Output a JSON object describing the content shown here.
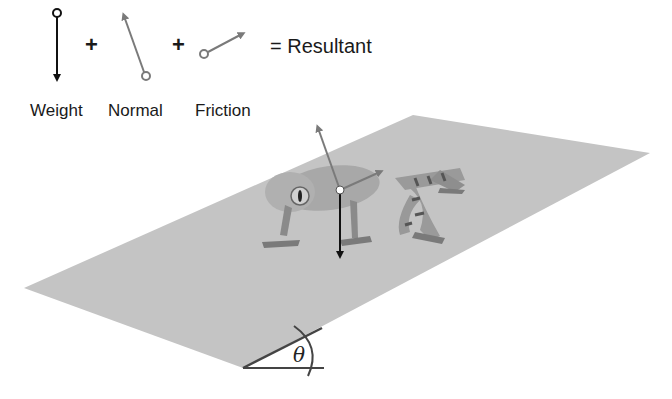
{
  "legend": {
    "weight_label": "Weight",
    "normal_label": "Normal",
    "friction_label": "Friction",
    "plus_1": "+",
    "plus_2": "+",
    "resultant_label": "= Resultant"
  },
  "diagram": {
    "angle_symbol": "θ",
    "colors": {
      "plane": "#c4c4c4",
      "weight_arrow": "#111111",
      "normal_arrow": "#7a7a7a",
      "friction_arrow": "#7a7a7a",
      "frog_body": "#a8a8a8",
      "frog_stripes": "#555555"
    }
  }
}
